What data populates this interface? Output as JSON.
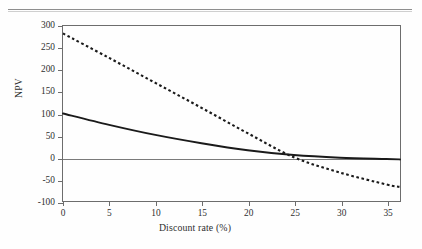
{
  "page": {
    "header_text": "",
    "rule": "horizontal-rule"
  },
  "figure": {
    "y_axis_title": "NPV",
    "x_axis_title": "Discount rate (%)"
  },
  "chart_data": {
    "type": "line",
    "title": "",
    "subtitle": "",
    "xlabel": "Discount rate (%)",
    "ylabel": "NPV",
    "xlim": [
      0,
      36.5
    ],
    "ylim": [
      -100,
      300
    ],
    "xticks": [
      0,
      5,
      10,
      15,
      20,
      25,
      30,
      35
    ],
    "xtick_labels": [
      "0",
      "5",
      "10",
      "15",
      "20",
      "25",
      "30",
      "35"
    ],
    "yticks": [
      -100,
      -50,
      0,
      50,
      100,
      150,
      200,
      250,
      300
    ],
    "ytick_labels": [
      "-100",
      "-50",
      "0",
      "50",
      "100",
      "150",
      "200",
      "250",
      "300"
    ],
    "grid": false,
    "legend": "none",
    "zero_line": 0,
    "series": [
      {
        "name": "Project A",
        "style": "solid",
        "color": "#1a1a1a",
        "x": [
          0,
          5,
          10,
          15,
          20,
          25,
          30,
          35,
          36.5
        ],
        "values": [
          100,
          74,
          51,
          32,
          16,
          5,
          -1,
          -4,
          -5
        ]
      },
      {
        "name": "Project B",
        "style": "dashed",
        "color": "#1a1a1a",
        "x": [
          0,
          5,
          10,
          15,
          20,
          25,
          30,
          35,
          36.5
        ],
        "values": [
          283,
          227,
          170,
          113,
          55,
          0,
          -35,
          -62,
          -68
        ]
      }
    ],
    "crossover_point": {
      "x": 23,
      "y": 9
    },
    "annotations": []
  }
}
